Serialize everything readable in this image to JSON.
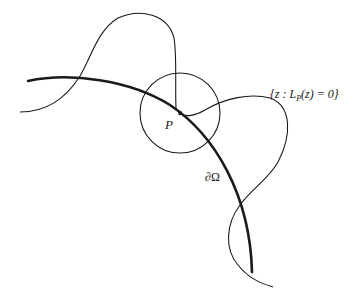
{
  "diagram": {
    "labels": {
      "point": "P",
      "boundary": "∂Ω",
      "zero_set": "{z : L",
      "zero_set_sub": "P",
      "zero_set_tail": "(z) = 0}"
    },
    "colors": {
      "stroke": "#1a1a1a",
      "background": "#ffffff"
    }
  }
}
